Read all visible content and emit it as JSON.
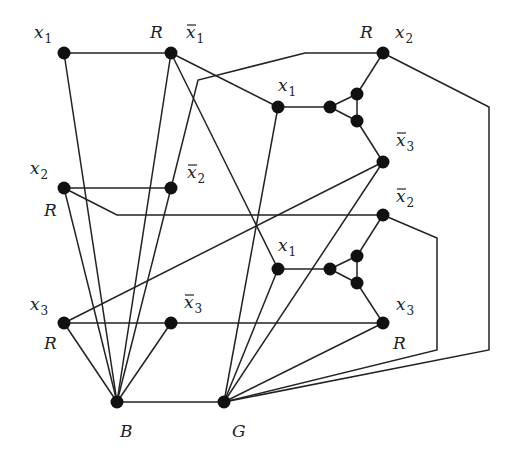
{
  "diagram": {
    "type": "graph-3-coloring-reduction",
    "colors": {
      "edge": "#222222",
      "node": "#111111",
      "background": "#ffffff"
    },
    "nodes": [
      {
        "id": "x1",
        "x": 64,
        "y": 53,
        "label": "x",
        "sub": "1",
        "bar": false,
        "tag": "",
        "lx": 34,
        "ly": 38,
        "tx": 0,
        "ty": 0
      },
      {
        "id": "nx1",
        "x": 171,
        "y": 53,
        "label": "x",
        "sub": "1",
        "bar": true,
        "tag": "R",
        "lx": 186,
        "ly": 38,
        "tx": 150,
        "ty": 38
      },
      {
        "id": "x2",
        "x": 64,
        "y": 188,
        "label": "x",
        "sub": "2",
        "bar": false,
        "tag": "R",
        "lx": 30,
        "ly": 174,
        "tx": 44,
        "ty": 216
      },
      {
        "id": "nx2",
        "x": 171,
        "y": 188,
        "label": "x",
        "sub": "2",
        "bar": true,
        "tag": "",
        "lx": 187,
        "ly": 178,
        "tx": 0,
        "ty": 0
      },
      {
        "id": "x3",
        "x": 64,
        "y": 323,
        "label": "x",
        "sub": "3",
        "bar": false,
        "tag": "R",
        "lx": 30,
        "ly": 310,
        "tx": 44,
        "ty": 349
      },
      {
        "id": "nx3",
        "x": 171,
        "y": 323,
        "label": "x",
        "sub": "3",
        "bar": true,
        "tag": "",
        "lx": 184,
        "ly": 308,
        "tx": 0,
        "ty": 0
      },
      {
        "id": "B",
        "x": 117,
        "y": 402,
        "label": "B",
        "sub": "",
        "bar": false,
        "tag": "",
        "lx": 120,
        "ly": 437,
        "tx": 0,
        "ty": 0
      },
      {
        "id": "G",
        "x": 224,
        "y": 402,
        "label": "G",
        "sub": "",
        "bar": false,
        "tag": "",
        "lx": 232,
        "ly": 437,
        "tx": 0,
        "ty": 0
      },
      {
        "id": "c1x1",
        "x": 278,
        "y": 107,
        "label": "x",
        "sub": "1",
        "bar": false,
        "tag": "",
        "lx": 278,
        "ly": 91,
        "tx": 0,
        "ty": 0
      },
      {
        "id": "c1t1",
        "x": 330,
        "y": 107,
        "label": "",
        "sub": "",
        "bar": false,
        "tag": "",
        "lx": 0,
        "ly": 0,
        "tx": 0,
        "ty": 0
      },
      {
        "id": "c1t2",
        "x": 357,
        "y": 94,
        "label": "",
        "sub": "",
        "bar": false,
        "tag": "",
        "lx": 0,
        "ly": 0,
        "tx": 0,
        "ty": 0
      },
      {
        "id": "c1t3",
        "x": 357,
        "y": 121,
        "label": "",
        "sub": "",
        "bar": false,
        "tag": "",
        "lx": 0,
        "ly": 0,
        "tx": 0,
        "ty": 0
      },
      {
        "id": "c1x2",
        "x": 383,
        "y": 53,
        "label": "x",
        "sub": "2",
        "bar": false,
        "tag": "R",
        "lx": 395,
        "ly": 38,
        "tx": 360,
        "ty": 38
      },
      {
        "id": "c1nx3",
        "x": 383,
        "y": 162,
        "label": "x",
        "sub": "3",
        "bar": true,
        "tag": "",
        "lx": 396,
        "ly": 146,
        "tx": 0,
        "ty": 0
      },
      {
        "id": "c2x1",
        "x": 278,
        "y": 269,
        "label": "x",
        "sub": "1",
        "bar": false,
        "tag": "",
        "lx": 278,
        "ly": 251,
        "tx": 0,
        "ty": 0
      },
      {
        "id": "c2t1",
        "x": 330,
        "y": 269,
        "label": "",
        "sub": "",
        "bar": false,
        "tag": "",
        "lx": 0,
        "ly": 0,
        "tx": 0,
        "ty": 0
      },
      {
        "id": "c2t2",
        "x": 357,
        "y": 256,
        "label": "",
        "sub": "",
        "bar": false,
        "tag": "",
        "lx": 0,
        "ly": 0,
        "tx": 0,
        "ty": 0
      },
      {
        "id": "c2t3",
        "x": 357,
        "y": 283,
        "label": "",
        "sub": "",
        "bar": false,
        "tag": "",
        "lx": 0,
        "ly": 0,
        "tx": 0,
        "ty": 0
      },
      {
        "id": "c2nx2",
        "x": 383,
        "y": 215,
        "label": "x",
        "sub": "2",
        "bar": true,
        "tag": "",
        "lx": 396,
        "ly": 202,
        "tx": 0,
        "ty": 0
      },
      {
        "id": "c2x3",
        "x": 383,
        "y": 323,
        "label": "x",
        "sub": "3",
        "bar": false,
        "tag": "R",
        "lx": 396,
        "ly": 310,
        "tx": 393,
        "ty": 349
      }
    ],
    "edges": [
      "64,53 171,53",
      "64,53 117,402",
      "171,53 117,402",
      "171,53 278,107",
      "171,53 278,269",
      "64,188 171,188",
      "64,188 117,402",
      "64,188 117,215 383,215",
      "171,188 117,402",
      "171,188 198,80 305,53 383,53",
      "64,323 171,323",
      "64,323 117,402",
      "64,323 383,162",
      "171,323 117,402",
      "171,323 383,323",
      "117,402 224,402",
      "278,107 330,107",
      "330,107 357,94",
      "330,107 357,121",
      "357,94 357,121",
      "357,94 383,53",
      "357,121 383,162",
      "278,269 330,269",
      "330,269 357,256",
      "330,269 357,283",
      "357,256 357,283",
      "357,256 383,215",
      "357,283 383,323",
      "224,402 278,107",
      "224,402 383,162",
      "224,402 278,269",
      "224,402 383,323",
      "224,402 437,350 437,238 383,215",
      "224,402 489,350 489,107 383,53"
    ]
  }
}
